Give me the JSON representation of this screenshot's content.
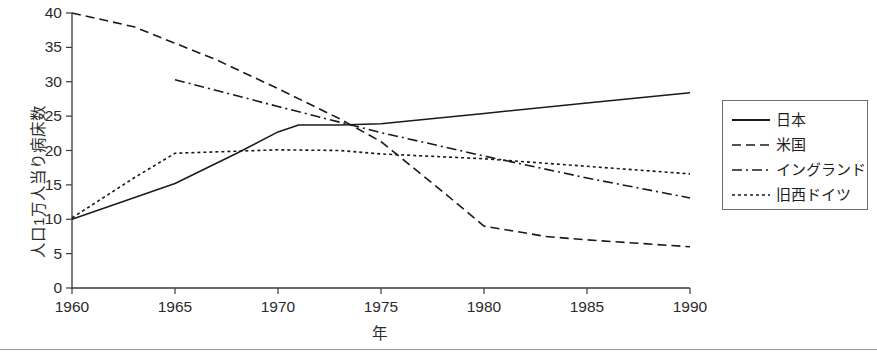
{
  "chart_data": {
    "type": "line",
    "title": "",
    "xlabel": "年",
    "ylabel": "人口1万人当り病床数",
    "xlim": [
      1960,
      1990
    ],
    "ylim": [
      0,
      40
    ],
    "xticks": [
      1960,
      1965,
      1970,
      1975,
      1980,
      1985,
      1990
    ],
    "yticks": [
      0,
      5,
      10,
      15,
      20,
      25,
      30,
      35,
      40
    ],
    "grid": false,
    "legend_position": "right",
    "series": [
      {
        "name": "日本",
        "style": "solid",
        "color": "#1a1a1a",
        "x": [
          1960,
          1965,
          1968,
          1970,
          1971,
          1973,
          1975,
          1980,
          1985,
          1990
        ],
        "values": [
          10.0,
          15.2,
          19.6,
          22.7,
          23.7,
          23.7,
          23.9,
          25.4,
          26.9,
          28.4
        ]
      },
      {
        "name": "米国",
        "style": "dashed",
        "color": "#1a1a1a",
        "x": [
          1960,
          1963,
          1965,
          1967,
          1970,
          1973,
          1975,
          1978,
          1980,
          1983,
          1985,
          1990
        ],
        "values": [
          40.0,
          38.0,
          35.6,
          33.2,
          29.0,
          24.6,
          21.3,
          14.0,
          9.0,
          7.5,
          7.0,
          6.0
        ]
      },
      {
        "name": "イングランド",
        "style": "dashdot",
        "color": "#1a1a1a",
        "x": [
          1965,
          1970,
          1975,
          1980,
          1985,
          1990
        ],
        "values": [
          30.3,
          26.4,
          22.6,
          19.2,
          16.0,
          13.1
        ]
      },
      {
        "name": "旧西ドイツ",
        "style": "dotted",
        "color": "#1a1a1a",
        "x": [
          1960,
          1963,
          1965,
          1970,
          1973,
          1975,
          1980,
          1985,
          1990
        ],
        "values": [
          10.2,
          16.0,
          19.6,
          20.1,
          20.0,
          19.5,
          18.8,
          17.7,
          16.6
        ]
      }
    ]
  },
  "axis": {
    "y_tick_labels": [
      "40",
      "35",
      "30",
      "25",
      "20",
      "15",
      "10",
      "5",
      "0"
    ],
    "x_tick_labels": [
      "1960",
      "1965",
      "1970",
      "1975",
      "1980",
      "1985",
      "1990"
    ],
    "y_title": "人口1万人当り病床数",
    "x_title": "年"
  },
  "legend": {
    "items": [
      {
        "label": "日本",
        "style": "solid"
      },
      {
        "label": "米国",
        "style": "dashed"
      },
      {
        "label": "イングランド",
        "style": "dashdot"
      },
      {
        "label": "旧西ドイツ",
        "style": "dotted"
      }
    ]
  }
}
